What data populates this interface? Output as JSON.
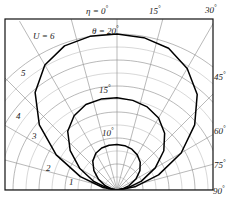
{
  "figure": {
    "kind": "polar-plot",
    "background": "#ffffff",
    "ink": "#111111",
    "grid_color": "#8a8a8a",
    "curve_color": "#000000"
  },
  "labels": {
    "eta_zero": "η = 0",
    "eta_zero_deg": "°",
    "theta_20": "θ = 20",
    "theta_20_deg": "°",
    "u_six": "U = 6",
    "curve_15": "15",
    "curve_15_deg": "°",
    "curve_10": "10",
    "curve_10_deg": "°"
  },
  "angle_ticks": [
    {
      "value": "0",
      "deg": "°",
      "angle_deg": 0,
      "position": "top"
    },
    {
      "value": "15",
      "deg": "°",
      "angle_deg": 15,
      "position": "top"
    },
    {
      "value": "30",
      "deg": "°",
      "angle_deg": 30,
      "position": "top-right"
    },
    {
      "value": "45",
      "deg": "°",
      "angle_deg": 45,
      "position": "right"
    },
    {
      "value": "60",
      "deg": "°",
      "angle_deg": 60,
      "position": "right"
    },
    {
      "value": "75",
      "deg": "°",
      "angle_deg": 75,
      "position": "right"
    },
    {
      "value": "90",
      "deg": "°",
      "angle_deg": 90,
      "position": "bottom-right"
    }
  ],
  "radial_ticks": [
    {
      "value": "1",
      "r": 1
    },
    {
      "value": "2",
      "r": 2
    },
    {
      "value": "3",
      "r": 3
    },
    {
      "value": "4",
      "r": 4
    },
    {
      "value": "5",
      "r": 5
    },
    {
      "value": "6",
      "r": 6
    }
  ],
  "chart_data": {
    "type": "line",
    "title": "",
    "subtitle": "",
    "projection": "polar",
    "xlabel": "η (deg)",
    "ylabel": "U",
    "grid": true,
    "legend": "none",
    "angle_unit": "degrees",
    "angle_axis": {
      "label": "η",
      "ticks": [
        0,
        15,
        30,
        45,
        60,
        75,
        90
      ],
      "tick_labels": [
        "0°",
        "15°",
        "30°",
        "45°",
        "60°",
        "75°",
        "90°"
      ],
      "range": [
        -90,
        90
      ],
      "zero_direction": "up"
    },
    "radial_axis": {
      "label": "U",
      "ticks": [
        1,
        2,
        3,
        4,
        5,
        6
      ],
      "tick_labels": [
        "1",
        "2",
        "3",
        "4",
        "5",
        "6"
      ],
      "range": [
        0,
        6
      ],
      "max_label": "U = 6"
    },
    "series": [
      {
        "name": "θ = 20°",
        "label": "θ = 20°",
        "peak_radius": 6.0,
        "angles": [
          -90,
          -80,
          -70,
          -60,
          -50,
          -40,
          -30,
          -20,
          -10,
          0,
          10,
          20,
          30,
          40,
          50,
          60,
          70,
          80,
          90
        ],
        "values": [
          0.0,
          0.55,
          1.5,
          2.7,
          3.9,
          4.9,
          5.55,
          5.9,
          6.0,
          6.0,
          5.95,
          5.8,
          5.4,
          4.8,
          3.9,
          2.85,
          1.7,
          0.7,
          0.0
        ]
      },
      {
        "name": "θ = 15°",
        "label": "15°",
        "peak_radius": 3.55,
        "angles": [
          -90,
          -80,
          -70,
          -60,
          -50,
          -40,
          -30,
          -20,
          -10,
          0,
          10,
          20,
          30,
          40,
          50,
          60,
          70,
          80,
          90
        ],
        "values": [
          0.0,
          0.35,
          0.95,
          1.65,
          2.35,
          2.95,
          3.3,
          3.5,
          3.55,
          3.55,
          3.5,
          3.4,
          3.2,
          2.85,
          2.35,
          1.7,
          1.0,
          0.4,
          0.0
        ]
      },
      {
        "name": "θ = 10°",
        "label": "10°",
        "peak_radius": 1.75,
        "angles": [
          -90,
          -80,
          -70,
          -60,
          -50,
          -40,
          -30,
          -20,
          -10,
          0,
          10,
          20,
          30,
          40,
          50,
          60,
          70,
          80,
          90
        ],
        "values": [
          0.0,
          0.18,
          0.48,
          0.82,
          1.16,
          1.45,
          1.63,
          1.72,
          1.75,
          1.75,
          1.73,
          1.67,
          1.56,
          1.39,
          1.15,
          0.84,
          0.5,
          0.2,
          0.0
        ]
      }
    ]
  }
}
